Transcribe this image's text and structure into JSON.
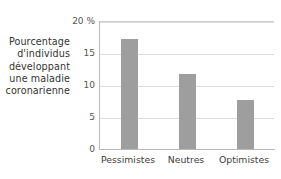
{
  "chart_data": {
    "type": "bar",
    "title": "",
    "subtitle": "",
    "xlabel": "",
    "ylabel": "Pourcentage d'individus développant une maladie coronarienne",
    "ylabel_lines": [
      "Pourcentage",
      "d'individus",
      "développant",
      "une maladie",
      "coronarienne"
    ],
    "categories": [
      "Pessimistes",
      "Neutres",
      "Optimistes"
    ],
    "values": [
      17.3,
      11.8,
      7.8
    ],
    "ylim": [
      0,
      20
    ],
    "yticks": [
      0,
      5,
      10,
      15,
      20
    ],
    "ytick_labels": [
      "0",
      "5",
      "10",
      "15",
      "20 %"
    ],
    "unit": "%",
    "grid": true,
    "legend": false,
    "legend_position": "none",
    "bar_color": "#9e9e9e",
    "grid_color": "#dcdcdc",
    "axis_color": "#b9b9b9",
    "text_color": "#3a3a3a",
    "background": "#ffffff"
  }
}
